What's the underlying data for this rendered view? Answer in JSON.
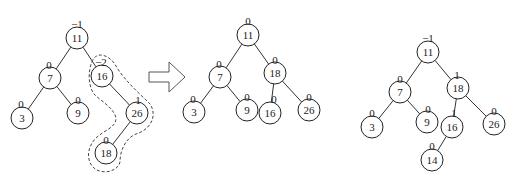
{
  "trees": [
    {
      "id": "before",
      "nodes": [
        {
          "key": "11",
          "bf": "−1",
          "x": 77,
          "y": 38,
          "bx": 77,
          "by": 24
        },
        {
          "key": "7",
          "bf": "0",
          "x": 50,
          "y": 78,
          "bx": 49,
          "by": 65
        },
        {
          "key": "3",
          "bf": "0",
          "x": 22,
          "y": 118,
          "bx": 21,
          "by": 104
        },
        {
          "key": "9",
          "bf": "0",
          "x": 78,
          "y": 113,
          "bx": 78,
          "by": 100
        },
        {
          "key": "16",
          "bf": "−2",
          "x": 102,
          "y": 76,
          "bx": 101,
          "by": 62
        },
        {
          "key": "26",
          "bf": "1",
          "x": 137,
          "y": 113,
          "bx": 138,
          "by": 100
        },
        {
          "key": "18",
          "bf": "0",
          "x": 106,
          "y": 153,
          "bx": 106,
          "by": 140
        }
      ],
      "edges": [
        [
          0,
          1
        ],
        [
          1,
          2
        ],
        [
          1,
          3
        ],
        [
          0,
          4
        ],
        [
          4,
          5
        ],
        [
          5,
          6
        ]
      ]
    },
    {
      "id": "after-rotation",
      "nodes": [
        {
          "key": "11",
          "bf": "0",
          "x": 248,
          "y": 35,
          "bx": 248,
          "by": 21
        },
        {
          "key": "7",
          "bf": "0",
          "x": 220,
          "y": 77,
          "bx": 219,
          "by": 64
        },
        {
          "key": "18",
          "bf": "0",
          "x": 275,
          "y": 73,
          "bx": 275,
          "by": 60
        },
        {
          "key": "3",
          "bf": "0",
          "x": 194,
          "y": 112,
          "bx": 193,
          "by": 99
        },
        {
          "key": "9",
          "bf": "0",
          "x": 247,
          "y": 110,
          "bx": 247,
          "by": 97
        },
        {
          "key": "16",
          "bf": "0",
          "x": 270,
          "y": 113,
          "bx": 274,
          "by": 99
        },
        {
          "key": "26",
          "bf": "0",
          "x": 309,
          "y": 110,
          "bx": 309,
          "by": 97
        }
      ],
      "edges": [
        [
          0,
          1
        ],
        [
          0,
          2
        ],
        [
          1,
          3
        ],
        [
          1,
          4
        ],
        [
          2,
          5
        ],
        [
          2,
          6
        ]
      ]
    },
    {
      "id": "after-insert-14",
      "nodes": [
        {
          "key": "11",
          "bf": "−1",
          "x": 428,
          "y": 52,
          "bx": 428,
          "by": 38
        },
        {
          "key": "7",
          "bf": "0",
          "x": 400,
          "y": 92,
          "bx": 400,
          "by": 79
        },
        {
          "key": "18",
          "bf": "1",
          "x": 458,
          "y": 88,
          "bx": 457,
          "by": 75
        },
        {
          "key": "3",
          "bf": "0",
          "x": 372,
          "y": 127,
          "bx": 372,
          "by": 113
        },
        {
          "key": "9",
          "bf": "0",
          "x": 427,
          "y": 122,
          "bx": 428,
          "by": 109
        },
        {
          "key": "16",
          "bf": "1",
          "x": 452,
          "y": 127,
          "bx": 454,
          "by": 113
        },
        {
          "key": "26",
          "bf": "0",
          "x": 494,
          "y": 124,
          "bx": 494,
          "by": 111
        },
        {
          "key": "14",
          "bf": "0",
          "x": 432,
          "y": 160,
          "bx": 432,
          "by": 146
        }
      ],
      "edges": [
        [
          0,
          1
        ],
        [
          0,
          2
        ],
        [
          1,
          3
        ],
        [
          1,
          4
        ],
        [
          2,
          5
        ],
        [
          2,
          6
        ],
        [
          5,
          7
        ]
      ]
    }
  ],
  "arrow": {
    "label": "transform-arrow"
  }
}
